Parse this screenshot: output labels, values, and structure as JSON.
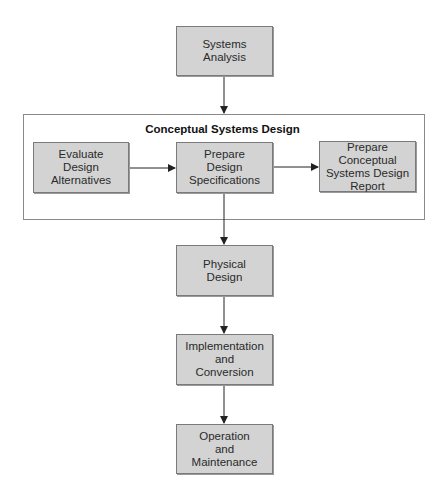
{
  "diagram": {
    "type": "flowchart",
    "nodes": [
      {
        "id": "systems-analysis",
        "label": "Systems\nAnalysis"
      },
      {
        "id": "evaluate",
        "label": "Evaluate\nDesign\nAlternatives"
      },
      {
        "id": "prepare-specs",
        "label": "Prepare\nDesign\nSpecifications"
      },
      {
        "id": "prepare-report",
        "label": "Prepare Conceptual\nSystems Design\nReport"
      },
      {
        "id": "physical-design",
        "label": "Physical\nDesign"
      },
      {
        "id": "implementation",
        "label": "Implementation\nand\nConversion"
      },
      {
        "id": "operation",
        "label": "Operation\nand\nMaintenance"
      }
    ],
    "group": {
      "title": "Conceptual Systems Design",
      "members": [
        "evaluate",
        "prepare-specs",
        "prepare-report"
      ]
    },
    "edges": [
      {
        "from": "systems-analysis",
        "to": "group"
      },
      {
        "from": "evaluate",
        "to": "prepare-specs"
      },
      {
        "from": "prepare-specs",
        "to": "prepare-report"
      },
      {
        "from": "prepare-specs",
        "to": "physical-design"
      },
      {
        "from": "physical-design",
        "to": "implementation"
      },
      {
        "from": "implementation",
        "to": "operation"
      }
    ],
    "colors": {
      "box_fill": "#d3d3d3",
      "box_border": "#7a7a7a",
      "line": "#222222"
    }
  }
}
